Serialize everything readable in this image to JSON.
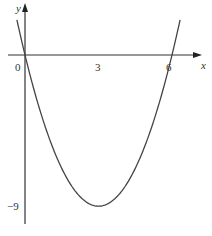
{
  "chart_data": {
    "type": "line",
    "title": "",
    "xlabel": "x",
    "ylabel": "y",
    "function": "y = x^2 - 6x",
    "x_ticks": [
      0,
      3,
      6
    ],
    "x_tick_labels": [
      "0",
      "3",
      "6"
    ],
    "y_ticks": [
      -9
    ],
    "y_tick_labels": [
      "−9"
    ],
    "series": [
      {
        "name": "parabola",
        "x": [
          -0.25,
          0,
          0.5,
          1,
          1.5,
          2,
          2.5,
          3,
          3.5,
          4,
          4.5,
          5,
          5.5,
          6,
          6.25
        ],
        "y": [
          1.5625,
          0,
          -2.75,
          -5,
          -6.75,
          -8,
          -8.75,
          -9,
          -8.75,
          -8,
          -6.75,
          -5,
          -2.75,
          0,
          1.5625
        ]
      }
    ],
    "roots": [
      0,
      6
    ],
    "vertex": [
      3,
      -9
    ],
    "xlim": [
      -1,
      7
    ],
    "ylim": [
      -10.5,
      3
    ],
    "grid": false,
    "legend": null,
    "colors": {
      "axis": "#333333",
      "curve": "#444444"
    }
  },
  "labels": {
    "x_axis": "x",
    "y_axis": "y",
    "origin": "0",
    "x_tick_3": "3",
    "x_tick_6": "6",
    "y_tick_neg9": "−9"
  }
}
